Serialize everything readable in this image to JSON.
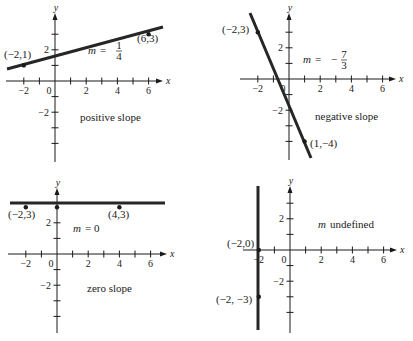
{
  "figure": {
    "width": 413,
    "height": 341,
    "ink_color": "#1a1a1a",
    "line_color": "#262626",
    "background": "#ffffff"
  },
  "chart_data": [
    {
      "type": "line",
      "id": "positive",
      "title": "positive slope",
      "slope_label": "m = 1/4",
      "slope_text": {
        "m": "m",
        "eq": "=",
        "num": "1",
        "den": "4",
        "sign": ""
      },
      "xlabel": "x",
      "ylabel": "y",
      "xlim": [
        -2.5,
        7
      ],
      "ylim": [
        -5,
        4.5
      ],
      "x_tick_labels": [
        "-2",
        "0",
        "2",
        "4",
        "6"
      ],
      "y_tick_labels": [
        "2",
        "-2"
      ],
      "grid": false,
      "points": [
        {
          "x": -2,
          "y": 1,
          "label": "(−2,1)"
        },
        {
          "x": 6,
          "y": 3,
          "label": "(6,3)"
        }
      ],
      "line": {
        "kind": "sloped",
        "slope": 0.25,
        "intercept": 1.5
      },
      "layout": {
        "origin_px": [
          55,
          81
        ],
        "unit_px": 15.6,
        "x_axis_px": [
          6,
          163
        ],
        "y_axis_px": [
          13,
          162
        ],
        "line_px": [
          [
            7,
            69
          ],
          [
            163,
            27
          ]
        ],
        "point_label_px": [
          [
            4,
            58
          ],
          [
            137,
            42
          ]
        ],
        "slope_px": [
          88,
          54
        ],
        "caption_px": [
          80,
          121
        ],
        "y_ticks": [
          3,
          2,
          1,
          -1,
          -2,
          -3,
          -4
        ],
        "x_ticks": [
          -2,
          -1,
          1,
          2,
          3,
          4,
          5,
          6
        ]
      }
    },
    {
      "type": "line",
      "id": "negative",
      "title": "negative slope",
      "slope_label": "m = −7/3",
      "slope_text": {
        "m": "m",
        "eq": "=",
        "num": "7",
        "den": "3",
        "sign": "−"
      },
      "xlabel": "x",
      "ylabel": "y",
      "xlim": [
        -2.5,
        7
      ],
      "ylim": [
        -5,
        4.5
      ],
      "x_tick_labels": [
        "-2",
        "0",
        "2",
        "4",
        "6"
      ],
      "y_tick_labels": [
        "2",
        "-2"
      ],
      "grid": false,
      "points": [
        {
          "x": -2,
          "y": 3,
          "label": "(−2,3)"
        },
        {
          "x": 1,
          "y": -4,
          "label": "(1,−4)"
        }
      ],
      "line": {
        "kind": "sloped",
        "slope": -2.3333,
        "intercept": -1.6667
      },
      "layout": {
        "origin_px": [
          289,
          79
        ],
        "unit_px": 15.6,
        "x_axis_px": [
          240,
          396
        ],
        "y_axis_px": [
          13,
          160
        ],
        "line_px": [
          [
            250,
            13
          ],
          [
            311,
            158
          ]
        ],
        "point_label_px": [
          [
            222,
            33
          ],
          [
            310,
            147
          ]
        ],
        "slope_px": [
          303,
          63
        ],
        "caption_px": [
          315,
          120
        ],
        "y_ticks": [
          3,
          2,
          1,
          -1,
          -2,
          -3,
          -4
        ],
        "x_ticks": [
          -2,
          -1,
          1,
          2,
          3,
          4,
          5,
          6
        ]
      }
    },
    {
      "type": "line",
      "id": "zero",
      "title": "zero slope",
      "slope_label": "m = 0",
      "slope_text": {
        "m": "m",
        "eq": "= 0",
        "num": "",
        "den": "",
        "sign": ""
      },
      "xlabel": "x",
      "ylabel": "y",
      "xlim": [
        -2.5,
        7
      ],
      "ylim": [
        -5,
        4.5
      ],
      "x_tick_labels": [
        "-2",
        "0",
        "2",
        "4",
        "6"
      ],
      "y_tick_labels": [
        "2",
        "-2"
      ],
      "grid": false,
      "points": [
        {
          "x": -2,
          "y": 3,
          "label": "(−2,3)"
        },
        {
          "x": 0,
          "y": 3,
          "label": ""
        },
        {
          "x": 4,
          "y": 3,
          "label": "(4,3)"
        }
      ],
      "line": {
        "kind": "horizontal",
        "slope": 0,
        "intercept": 3
      },
      "layout": {
        "origin_px": [
          57,
          254
        ],
        "unit_px": 15.6,
        "x_axis_px": [
          8,
          167
        ],
        "y_axis_px": [
          188,
          333
        ],
        "line_px": [
          [
            10,
            203
          ],
          [
            165,
            203
          ]
        ],
        "point_label_px": [
          [
            8,
            218
          ],
          [
            108,
            218
          ]
        ],
        "slope_px": [
          73,
          232
        ],
        "caption_px": [
          87,
          292
        ],
        "y_ticks": [
          2,
          1,
          -1,
          -2,
          -3,
          -4
        ],
        "x_ticks": [
          -2,
          -1,
          1,
          2,
          3,
          4,
          5,
          6
        ]
      }
    },
    {
      "type": "line",
      "id": "undefined",
      "title": "",
      "slope_label": "m undefined",
      "slope_text": {
        "m": "m",
        "eq": "undefined",
        "num": "",
        "den": "",
        "sign": ""
      },
      "xlabel": "x",
      "ylabel": "y",
      "xlim": [
        -2.5,
        7
      ],
      "ylim": [
        -5,
        4.5
      ],
      "x_tick_labels": [
        "-2",
        "0",
        "2",
        "4",
        "6"
      ],
      "y_tick_labels": [
        "2",
        "-2"
      ],
      "grid": false,
      "points": [
        {
          "x": -2,
          "y": 0,
          "label": "(−2,0)"
        },
        {
          "x": -2,
          "y": -3,
          "label": "(−2, −3)"
        }
      ],
      "line": {
        "kind": "vertical",
        "x": -2
      },
      "layout": {
        "origin_px": [
          290,
          250
        ],
        "unit_px": 15.6,
        "x_axis_px": [
          243,
          397
        ],
        "y_axis_px": [
          186,
          333
        ],
        "line_px": [
          [
            258,
            186
          ],
          [
            258,
            330
          ]
        ],
        "point_label_px": [
          [
            227,
            247
          ],
          [
            216,
            303
          ]
        ],
        "slope_px": [
          318,
          228
        ],
        "caption_px": [
          0,
          0
        ],
        "y_ticks": [
          3,
          2,
          1,
          -1,
          -2,
          -3,
          -4
        ],
        "x_ticks": [
          -1,
          1,
          2,
          3,
          4,
          5,
          6
        ]
      }
    }
  ]
}
